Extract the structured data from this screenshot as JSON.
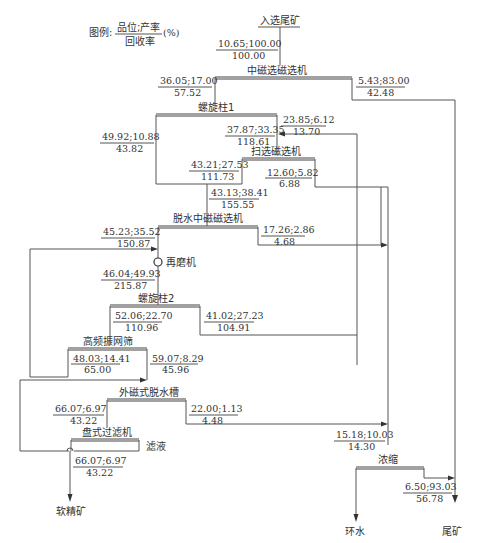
{
  "legend": {
    "prefix": "图例:",
    "numerator": "品位;产率",
    "denominator": "回收率",
    "unit": "(%)"
  },
  "feed": {
    "label": "入选尾矿",
    "top": "10.65;100.00",
    "bottom": "100.00"
  },
  "units": {
    "medium_mag": "中磁选磁选机",
    "spiral1": "螺旋柱1",
    "scav_mag": "扫选磁选机",
    "dewater_mag": "脱水中磁磁选机",
    "regrind": "再磨机",
    "spiral2": "螺旋柱2",
    "hf_screen": "高频振网筛",
    "ext_dewater": "外磁式脱水槽",
    "disc_filter": "盘式过滤机",
    "thickener": "浓缩"
  },
  "streams": {
    "mm_conc": {
      "top": "36.05;17.00",
      "bottom": "57.52"
    },
    "mm_tail": {
      "top": "5.43;83.00",
      "bottom": "42.48"
    },
    "sp1_left": {
      "top": "49.92;10.88",
      "bottom": "43.82"
    },
    "sp1_tail": {
      "top": "23.85;6.12",
      "bottom": "13.70"
    },
    "sp1_feed": {
      "top": "37.87;33.35",
      "bottom": "118.61"
    },
    "scav_conc": {
      "top": "43.21;27.53",
      "bottom": "111.73"
    },
    "scav_tail": {
      "top": "12.60;5.82",
      "bottom": "6.88"
    },
    "dw_feed": {
      "top": "43.13;38.41",
      "bottom": "155.55"
    },
    "dw_conc": {
      "top": "45.23;35.52",
      "bottom": "150.87"
    },
    "dw_tail": {
      "top": "17.26;2.86",
      "bottom": "4.68"
    },
    "regrind_out": {
      "top": "46.04;49.93",
      "bottom": "215.87"
    },
    "sp2_conc": {
      "top": "52.06;22.70",
      "bottom": "110.96"
    },
    "sp2_tail": {
      "top": "41.02;27.23",
      "bottom": "104.91"
    },
    "screen_over": {
      "top": "48.03;14.41",
      "bottom": "65.00"
    },
    "screen_under": {
      "top": "59.07;8.29",
      "bottom": "45.96"
    },
    "ext_conc": {
      "top": "66.07;6.97",
      "bottom": "43.22"
    },
    "ext_tail": {
      "top": "22.00;1.13",
      "bottom": "4.48"
    },
    "filter_out": {
      "top": "66.07;6.97",
      "bottom": "43.22"
    },
    "thick_feed": {
      "top": "15.18;10.03",
      "bottom": "14.30"
    },
    "thick_over": {
      "top": "6.50;93.03",
      "bottom": "56.78"
    }
  },
  "side_labels": {
    "filtrate": "滤液"
  },
  "products": {
    "concentrate": "软精矿",
    "return_water": "环水",
    "tailings": "尾矿"
  }
}
